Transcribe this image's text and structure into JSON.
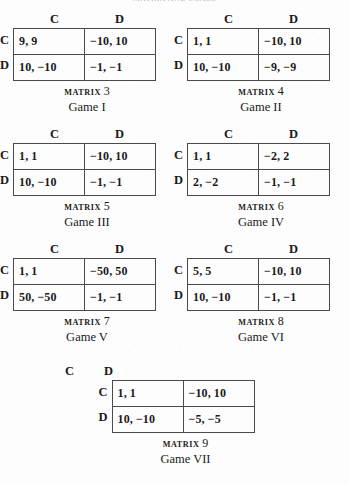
{
  "page": {
    "running_head": "MATRIX AND SCALE",
    "background_color": "#fdfdfd",
    "ink_color": "#1a1a1a",
    "rule_color": "#4a4a4a"
  },
  "labels": {
    "matrix_word": "MATRIX",
    "col_c": "C",
    "col_d": "D",
    "row_c": "C",
    "row_d": "D"
  },
  "games": [
    {
      "matrix_number": "3",
      "game_label": "Game I",
      "col_headers": [
        "C",
        "D"
      ],
      "row_headers": [
        "C",
        "D"
      ],
      "cells": [
        [
          "9, 9",
          "−10, 10"
        ],
        [
          "10, −10",
          "−1, −1"
        ]
      ]
    },
    {
      "matrix_number": "4",
      "game_label": "Game II",
      "col_headers": [
        "C",
        "D"
      ],
      "row_headers": [
        "C",
        "D"
      ],
      "cells": [
        [
          "1, 1",
          "−10, 10"
        ],
        [
          "10, −10",
          "−9, −9"
        ]
      ]
    },
    {
      "matrix_number": "5",
      "game_label": "Game III",
      "col_headers": [
        "C",
        "D"
      ],
      "row_headers": [
        "C",
        "D"
      ],
      "cells": [
        [
          "1, 1",
          "−10, 10"
        ],
        [
          "10, −10",
          "−1, −1"
        ]
      ]
    },
    {
      "matrix_number": "6",
      "game_label": "Game IV",
      "col_headers": [
        "C",
        "D"
      ],
      "row_headers": [
        "C",
        "D"
      ],
      "cells": [
        [
          "1, 1",
          "−2, 2"
        ],
        [
          "2, −2",
          "−1, −1"
        ]
      ]
    },
    {
      "matrix_number": "7",
      "game_label": "Game V",
      "col_headers": [
        "C",
        "D"
      ],
      "row_headers": [
        "C",
        "D"
      ],
      "cells": [
        [
          "1, 1",
          "−50, 50"
        ],
        [
          "50, −50",
          "−1, −1"
        ]
      ]
    },
    {
      "matrix_number": "8",
      "game_label": "Game VI",
      "col_headers": [
        "C",
        "D"
      ],
      "row_headers": [
        "C",
        "D"
      ],
      "cells": [
        [
          "5, 5",
          "−10, 10"
        ],
        [
          "10, −10",
          "−1, −1"
        ]
      ]
    },
    {
      "matrix_number": "9",
      "game_label": "Game VII",
      "col_headers": [
        "C",
        "D"
      ],
      "row_headers": [
        "C",
        "D"
      ],
      "cells": [
        [
          "1, 1",
          "−10, 10"
        ],
        [
          "10, −10",
          "−5, −5"
        ]
      ]
    }
  ]
}
